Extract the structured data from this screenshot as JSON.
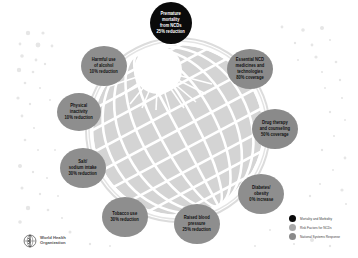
{
  "diagram": {
    "colors": {
      "mortality": "#0a0a0a",
      "risk_factor": "#8e8e8e",
      "national_system": "#8a8a8a",
      "globe_fill": "#d4d4d4",
      "globe_lines": "#ffffff"
    },
    "nodes": [
      {
        "id": "premature-mortality",
        "category": "mortality",
        "lines": [
          "Premature",
          "mortality",
          "from NCDs",
          "25% reduction"
        ]
      },
      {
        "id": "harmful-alcohol",
        "category": "risk",
        "lines": [
          "Harmful use",
          "of alcohol",
          "10% reduction"
        ]
      },
      {
        "id": "essential-medicines",
        "category": "system",
        "lines": [
          "Essential NCD",
          "medicines and",
          "technologies",
          "80% coverage"
        ]
      },
      {
        "id": "physical-inactivity",
        "category": "risk",
        "lines": [
          "Physical",
          "inactivity",
          "10% reduction"
        ]
      },
      {
        "id": "drug-therapy",
        "category": "system",
        "lines": [
          "Drug therapy",
          "and counseling",
          "50% coverage"
        ]
      },
      {
        "id": "salt-sodium",
        "category": "risk",
        "lines": [
          "Salt/",
          "sodium intake",
          "30% reduction"
        ]
      },
      {
        "id": "diabetes-obesity",
        "category": "risk",
        "lines": [
          "Diabetes/",
          "obesity",
          "0% increase"
        ]
      },
      {
        "id": "tobacco-use",
        "category": "risk",
        "lines": [
          "Tobacco use",
          "30% reduction"
        ]
      },
      {
        "id": "raised-blood-pressure",
        "category": "risk",
        "lines": [
          "Raised blood",
          "pressure",
          "25% reduction"
        ]
      }
    ]
  },
  "legend": {
    "items": [
      {
        "label": "Mortality and Morbidity",
        "color": "#0a0a0a"
      },
      {
        "label": "Risk Factors for NCDs",
        "color": "#a8a8a8"
      },
      {
        "label": "National Systems Response",
        "color": "#8a8a8a"
      }
    ]
  },
  "logo": {
    "line1": "World Health",
    "line2": "Organization"
  }
}
